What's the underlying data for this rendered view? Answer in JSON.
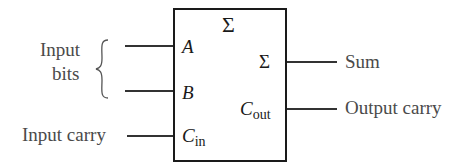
{
  "diagram": {
    "type": "full-adder block",
    "block_symbol": "Σ",
    "inputs": {
      "group_label_line1": "Input",
      "group_label_line2": "bits",
      "carry_label": "Input carry",
      "pins": [
        {
          "name": "A",
          "sub": ""
        },
        {
          "name": "B",
          "sub": ""
        },
        {
          "name": "C",
          "sub": "in"
        }
      ]
    },
    "outputs": {
      "pins": [
        {
          "name": "Σ",
          "sub": ""
        },
        {
          "name": "C",
          "sub": "out"
        }
      ],
      "labels": [
        "Sum",
        "Output carry"
      ]
    },
    "colors": {
      "box_stroke": "#1a1a1a",
      "text": "#4a4a4a",
      "wire": "#333333"
    }
  }
}
